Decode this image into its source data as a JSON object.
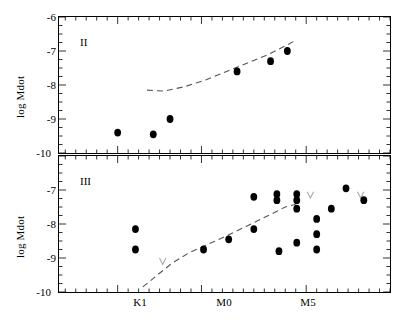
{
  "figure": {
    "type": "scatter",
    "ylabel": "log Mdot",
    "ylabel_lower": "log Mdot",
    "yticks": [
      "-6",
      "-7",
      "-8",
      "-9",
      "-10"
    ],
    "yvalues": [
      -6,
      -7,
      -8,
      -9,
      -10
    ],
    "ylim": [
      -10,
      -6
    ],
    "xticks": [
      "K1",
      "M0",
      "M5"
    ],
    "xtick_positions": [
      1,
      5,
      10
    ],
    "xlim": [
      -1.8,
      14.0
    ],
    "grid": false,
    "legend": false,
    "marker": "filled-circle",
    "limit_marker": "downward-v-arrow",
    "curve_style": "dashed"
  },
  "chart_data": [
    {
      "type": "scatter",
      "panel_label": "II",
      "title": "",
      "xlabel": "",
      "ylabel": "log Mdot",
      "ylim": [
        -10,
        -6
      ],
      "xlim": [
        -1.8,
        14.0
      ],
      "xtick_labels": [
        "K1",
        "M0",
        "M5"
      ],
      "xtick_values": [
        1,
        5,
        10
      ],
      "ytick_values": [
        -6,
        -7,
        -8,
        -9,
        -10
      ],
      "grid": false,
      "points": [
        {
          "x": 1.0,
          "y": -9.4,
          "limit": false
        },
        {
          "x": 2.7,
          "y": -9.45,
          "limit": false
        },
        {
          "x": 3.5,
          "y": -9.0,
          "limit": false
        },
        {
          "x": 6.7,
          "y": -7.6,
          "limit": false
        },
        {
          "x": 8.3,
          "y": -7.3,
          "limit": false
        },
        {
          "x": 9.1,
          "y": -7.0,
          "limit": false
        }
      ],
      "dashed_curve": [
        {
          "x": 2.4,
          "y": -8.15
        },
        {
          "x": 3.2,
          "y": -8.18
        },
        {
          "x": 4.2,
          "y": -8.05
        },
        {
          "x": 5.2,
          "y": -7.85
        },
        {
          "x": 6.2,
          "y": -7.6
        },
        {
          "x": 7.2,
          "y": -7.35
        },
        {
          "x": 8.2,
          "y": -7.1
        },
        {
          "x": 9.0,
          "y": -6.85
        },
        {
          "x": 9.4,
          "y": -6.72
        }
      ]
    },
    {
      "type": "scatter",
      "panel_label": "III",
      "title": "",
      "xlabel": "",
      "ylabel": "log Mdot",
      "ylim": [
        -10,
        -6
      ],
      "xlim": [
        -1.8,
        14.0
      ],
      "xtick_labels": [
        "K1",
        "M0",
        "M5"
      ],
      "xtick_values": [
        1,
        5,
        10
      ],
      "ytick_values": [
        -6,
        -7,
        -8,
        -9,
        -10
      ],
      "grid": false,
      "points": [
        {
          "x": 1.85,
          "y": -8.15,
          "limit": false
        },
        {
          "x": 1.85,
          "y": -8.75,
          "limit": false
        },
        {
          "x": 3.15,
          "y": -9.1,
          "limit": true
        },
        {
          "x": 5.1,
          "y": -8.75,
          "limit": false
        },
        {
          "x": 6.3,
          "y": -8.45,
          "limit": false
        },
        {
          "x": 7.5,
          "y": -8.15,
          "limit": false
        },
        {
          "x": 7.5,
          "y": -7.2,
          "limit": false
        },
        {
          "x": 8.6,
          "y": -7.12,
          "limit": false
        },
        {
          "x": 8.6,
          "y": -7.3,
          "limit": false
        },
        {
          "x": 8.7,
          "y": -8.8,
          "limit": false
        },
        {
          "x": 9.55,
          "y": -7.12,
          "limit": false
        },
        {
          "x": 9.55,
          "y": -7.3,
          "limit": false
        },
        {
          "x": 9.55,
          "y": -7.55,
          "limit": false
        },
        {
          "x": 9.55,
          "y": -8.55,
          "limit": false
        },
        {
          "x": 10.2,
          "y": -7.15,
          "limit": true
        },
        {
          "x": 10.5,
          "y": -7.85,
          "limit": false
        },
        {
          "x": 10.5,
          "y": -8.3,
          "limit": false
        },
        {
          "x": 10.5,
          "y": -8.75,
          "limit": false
        },
        {
          "x": 11.2,
          "y": -7.55,
          "limit": false
        },
        {
          "x": 11.9,
          "y": -6.95,
          "limit": false
        },
        {
          "x": 12.6,
          "y": -7.15,
          "limit": true
        },
        {
          "x": 12.75,
          "y": -7.3,
          "limit": false
        }
      ],
      "dashed_curve": [
        {
          "x": 2.2,
          "y": -9.85
        },
        {
          "x": 2.9,
          "y": -9.5
        },
        {
          "x": 3.6,
          "y": -9.15
        },
        {
          "x": 4.4,
          "y": -8.85
        },
        {
          "x": 5.3,
          "y": -8.6
        },
        {
          "x": 6.2,
          "y": -8.35
        },
        {
          "x": 7.2,
          "y": -8.05
        },
        {
          "x": 8.2,
          "y": -7.75
        },
        {
          "x": 9.0,
          "y": -7.5
        },
        {
          "x": 9.5,
          "y": -7.42
        }
      ]
    }
  ]
}
